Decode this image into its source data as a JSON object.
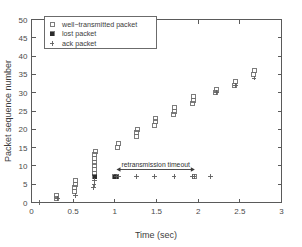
{
  "chart_data": {
    "type": "scatter",
    "title": "",
    "xlabel": "Time (sec)",
    "ylabel": "Packet sequence number",
    "xlim": [
      0,
      3
    ],
    "ylim": [
      0,
      50
    ],
    "xticks": [
      0,
      0.5,
      1,
      1.5,
      2,
      2.5,
      3
    ],
    "xticklabels": [
      "0",
      "0.5",
      "1",
      "1.5",
      "2",
      "2.5",
      "3"
    ],
    "yticks": [
      0,
      5,
      10,
      15,
      20,
      25,
      30,
      35,
      40,
      45,
      50
    ],
    "yticklabels": [
      "0",
      "5",
      "10",
      "15",
      "20",
      "25",
      "30",
      "35",
      "40",
      "45",
      "50"
    ],
    "grid": false,
    "legend_position": "upper left",
    "series": [
      {
        "name": "well-transmitted packet",
        "marker": "open-square",
        "points": [
          [
            0.3,
            1
          ],
          [
            0.3,
            2
          ],
          [
            0.52,
            3
          ],
          [
            0.52,
            4
          ],
          [
            0.53,
            5
          ],
          [
            0.53,
            6
          ],
          [
            0.75,
            8
          ],
          [
            0.75,
            9
          ],
          [
            0.75,
            10
          ],
          [
            0.76,
            11
          ],
          [
            0.76,
            12
          ],
          [
            0.76,
            13
          ],
          [
            0.77,
            14
          ],
          [
            1.03,
            15
          ],
          [
            1.04,
            16
          ],
          [
            1.26,
            18
          ],
          [
            1.26,
            19
          ],
          [
            1.27,
            20
          ],
          [
            1.48,
            21
          ],
          [
            1.49,
            22
          ],
          [
            1.49,
            23
          ],
          [
            1.7,
            24
          ],
          [
            1.71,
            25
          ],
          [
            1.71,
            26
          ],
          [
            1.93,
            27
          ],
          [
            1.94,
            28
          ],
          [
            1.94,
            29
          ],
          [
            1.96,
            7
          ],
          [
            2.21,
            30
          ],
          [
            2.22,
            31
          ],
          [
            2.44,
            32
          ],
          [
            2.45,
            33
          ],
          [
            2.66,
            35
          ],
          [
            2.67,
            36
          ]
        ]
      },
      {
        "name": "lost packet",
        "marker": "filled-square",
        "points": [
          [
            0.76,
            7
          ],
          [
            1.0,
            7
          ],
          [
            1.02,
            7
          ]
        ]
      },
      {
        "name": "ack packet",
        "marker": "plus",
        "points": [
          [
            0.1,
            0
          ],
          [
            0.31,
            1
          ],
          [
            0.53,
            2
          ],
          [
            0.74,
            4
          ],
          [
            0.75,
            5
          ],
          [
            0.76,
            6
          ],
          [
            1.02,
            7
          ],
          [
            1.04,
            7
          ],
          [
            1.26,
            7
          ],
          [
            1.48,
            7
          ],
          [
            1.71,
            7
          ],
          [
            1.93,
            7
          ],
          [
            1.95,
            7
          ],
          [
            2.15,
            7
          ],
          [
            2.22,
            30
          ],
          [
            2.45,
            32
          ],
          [
            2.67,
            34
          ]
        ]
      }
    ],
    "annotations": [
      {
        "text": "retransmission timeout",
        "x_start": 1.02,
        "x_end": 1.96,
        "y": 9.0,
        "style": "double-arrow"
      }
    ]
  },
  "legend": {
    "entries": [
      {
        "label": "well−transmitted packet",
        "marker": "open-square"
      },
      {
        "label": "lost packet",
        "marker": "filled-square"
      },
      {
        "label": "ack packet",
        "marker": "plus"
      }
    ]
  },
  "axes": {
    "xlabel": "Time (sec)",
    "ylabel": "Packet sequence number"
  }
}
